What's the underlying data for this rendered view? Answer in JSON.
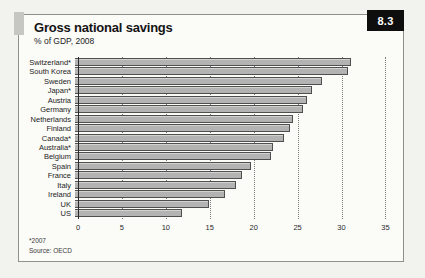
{
  "page": {
    "badge": "8.3",
    "title": "Gross national savings",
    "subtitle": "% of GDP, 2008",
    "footnote": "*2007",
    "source": "Source: OECD"
  },
  "colors": {
    "page_bg": "#f2f2ef",
    "panel_bg": "#fbfbf8",
    "badge_bg": "#0e0e0e",
    "bar_fill": "#b3b3b3",
    "bar_border": "#4f4f4f"
  },
  "chart_data": {
    "type": "bar",
    "orientation": "horizontal",
    "title": "Gross national savings",
    "subtitle": "% of GDP, 2008",
    "categories": [
      "Switzerland*",
      "South Korea",
      "Sweden",
      "Japan*",
      "Austria",
      "Germany",
      "Netherlands",
      "Finland",
      "Canada*",
      "Australia*",
      "Belgium",
      "Spain",
      "France",
      "Italy",
      "Ireland",
      "UK",
      "US"
    ],
    "values": [
      31.3,
      31.0,
      28.0,
      26.9,
      26.3,
      25.9,
      24.7,
      24.4,
      23.7,
      22.5,
      22.3,
      20.0,
      18.9,
      18.3,
      17.0,
      15.2,
      12.2
    ],
    "xlabel": "",
    "ylabel": "",
    "xlim": [
      0,
      37
    ],
    "xticks": [
      0,
      5,
      10,
      15,
      20,
      25,
      30,
      35
    ],
    "grid": "dotted-vertical",
    "legend": "none",
    "footnote": "*2007",
    "source": "Source: OECD"
  }
}
